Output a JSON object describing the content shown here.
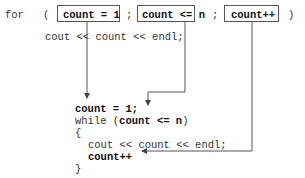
{
  "top": {
    "for_kw": "for",
    "open_paren": "(",
    "init": "count = 1",
    "sep1": ";",
    "cond": "count <= n",
    "sep2": ";",
    "incr": "count++",
    "close_paren": ")",
    "body": "cout << count << endl;"
  },
  "bottom": {
    "init": "count = 1;",
    "while_kw": "while (",
    "cond": "count <= n",
    "while_close": ")",
    "open_brace": "{",
    "body": "cout << count << endl;",
    "incr": "count++",
    "close_brace": "}"
  }
}
